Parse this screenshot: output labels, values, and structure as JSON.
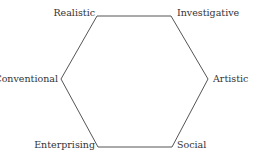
{
  "diagram": {
    "shape": "hexagon",
    "stroke_color": "#555555",
    "vertices": {
      "realistic": "Realistic",
      "investigative": "Investigative",
      "artistic": "Artistic",
      "social": "Social",
      "enterprising": "Enterprising",
      "conventional": "Conventional"
    }
  }
}
